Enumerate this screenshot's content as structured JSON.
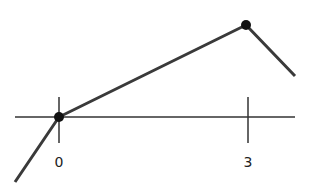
{
  "diagram": {
    "type": "piecewise-linear-graph",
    "axis": {
      "label_ticks": [
        "0",
        "3"
      ]
    },
    "points": [
      {
        "name": "origin",
        "x": 0,
        "y": 0
      },
      {
        "name": "peak",
        "x": 3,
        "y": "max"
      }
    ],
    "colors": {
      "line": "#3a3a3a",
      "axis": "#333333",
      "point": "#111111"
    }
  },
  "labels": {
    "tick_0": "0",
    "tick_3": "3"
  }
}
